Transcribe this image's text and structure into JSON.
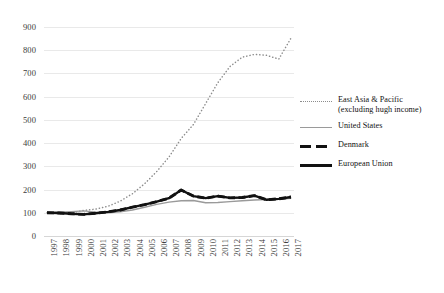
{
  "chart_data": {
    "type": "line",
    "title": "",
    "subtitle": "",
    "xlabel": "",
    "ylabel": "",
    "grid": true,
    "legend_position": "right",
    "ylim": [
      0,
      900
    ],
    "ytick_step": 100,
    "yticks": [
      "0",
      "100",
      "200",
      "300",
      "400",
      "500",
      "600",
      "700",
      "800",
      "900"
    ],
    "categories": [
      "1997",
      "1998",
      "1999",
      "2000",
      "2001",
      "2002",
      "2003",
      "2004",
      "2005",
      "2006",
      "2007",
      "2008",
      "2009",
      "2010",
      "2011",
      "2012",
      "2013",
      "2014",
      "2015",
      "2016",
      "2017"
    ],
    "series": [
      {
        "name": "East Asia & Pacific (excluding hugh income)",
        "style": "dotted",
        "color": "#8c8c8c",
        "values": [
          100,
          96,
          100,
          110,
          116,
          128,
          150,
          182,
          225,
          278,
          340,
          420,
          480,
          570,
          660,
          730,
          770,
          782,
          778,
          762,
          852
        ]
      },
      {
        "name": "United States",
        "style": "thin-solid",
        "color": "#9a9a9a",
        "values": [
          100,
          103,
          105,
          108,
          103,
          100,
          104,
          112,
          124,
          136,
          146,
          152,
          153,
          143,
          144,
          148,
          152,
          155,
          157,
          158,
          162
        ]
      },
      {
        "name": "Denmark",
        "style": "dashed",
        "color": "#111111",
        "values": [
          100,
          99,
          96,
          93,
          98,
          104,
          112,
          124,
          135,
          148,
          163,
          198,
          172,
          163,
          172,
          164,
          166,
          174,
          156,
          160,
          168
        ]
      },
      {
        "name": "European Union",
        "style": "thick-solid",
        "color": "#111111",
        "values": [
          100,
          99,
          96,
          93,
          98,
          104,
          112,
          124,
          135,
          148,
          163,
          198,
          172,
          163,
          172,
          164,
          166,
          174,
          156,
          160,
          168
        ]
      }
    ]
  },
  "legend": {
    "items": [
      {
        "label": "East Asia & Pacific (excluding hugh income)",
        "marker": "dotted-line-icon"
      },
      {
        "label": "United States",
        "marker": "thin-solid-line-icon"
      },
      {
        "label": "Denmark",
        "marker": "dashed-line-icon"
      },
      {
        "label": "European Union",
        "marker": "thick-solid-line-icon"
      }
    ]
  }
}
